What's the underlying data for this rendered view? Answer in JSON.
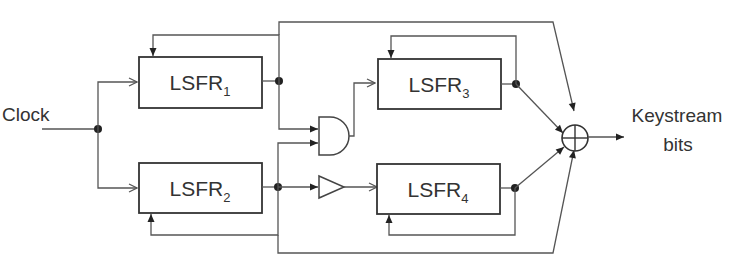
{
  "diagram": {
    "input_label": "Clock",
    "output_label_line1": "Keystream",
    "output_label_line2": "bits",
    "registers": [
      {
        "name": "LSFR",
        "index": "1"
      },
      {
        "name": "LSFR",
        "index": "2"
      },
      {
        "name": "LSFR",
        "index": "3"
      },
      {
        "name": "LSFR",
        "index": "4"
      }
    ],
    "gates": [
      "and-gate",
      "buffer",
      "xor"
    ]
  }
}
